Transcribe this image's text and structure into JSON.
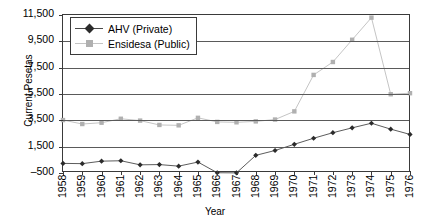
{
  "chart_data": {
    "type": "line",
    "title": "",
    "xlabel": "Year",
    "ylabel": "Current Pesetas",
    "x": [
      1958,
      1959,
      1960,
      1961,
      1962,
      1963,
      1964,
      1965,
      1966,
      1967,
      1968,
      1969,
      1970,
      1971,
      1972,
      1973,
      1974,
      1975,
      1976
    ],
    "xtick_labels": [
      "1958",
      "1959",
      "1960",
      "1961",
      "1962",
      "1963",
      "1964",
      "1965",
      "1966",
      "1967",
      "1968",
      "1969",
      "1970",
      "1971",
      "1972",
      "1973",
      "1974",
      "1975",
      "1976"
    ],
    "ytick_labels": [
      "11,500",
      "9,500",
      "7,500",
      "5,500",
      "3,500",
      "1,500",
      "–500"
    ],
    "ytick_values": [
      11500,
      9500,
      7500,
      5500,
      3500,
      1500,
      -500
    ],
    "ylim": [
      -500,
      11500
    ],
    "xlim": [
      1958,
      1976
    ],
    "grid": "horizontal",
    "legend_position": "top-left-inside",
    "series": [
      {
        "name": "AHV (Private)",
        "marker": "diamond",
        "color": "#2b2b2b",
        "line_color": "#4a4a4a",
        "values": [
          230,
          210,
          400,
          430,
          120,
          140,
          20,
          330,
          -480,
          -490,
          840,
          1210,
          1680,
          2140,
          2560,
          2930,
          3280,
          2830,
          2430
        ]
      },
      {
        "name": "Ensidesa (Public)",
        "marker": "square",
        "color": "#b0b0b0",
        "line_color": "#bdbdbd",
        "values": [
          3520,
          3220,
          3320,
          3620,
          3480,
          3150,
          3120,
          3690,
          3380,
          3350,
          3420,
          3560,
          4180,
          6950,
          7930,
          9620,
          11300,
          5480,
          5560
        ]
      }
    ]
  },
  "legend": {
    "items": [
      {
        "label": "AHV (Private)"
      },
      {
        "label": "Ensidesa (Public)"
      }
    ]
  },
  "axes": {
    "x_title": "Year",
    "y_title": "Current Pesetas"
  }
}
